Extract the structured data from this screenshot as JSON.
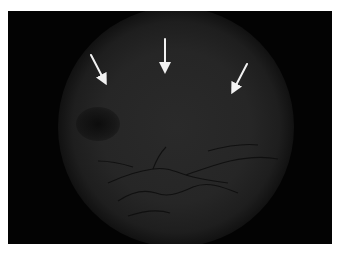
{
  "image": {
    "description": "Fundus photograph with three white arrows pointing toward the upper retina",
    "background_color": "#ffffff",
    "frame_color": "#030303",
    "fundus_color": "#262626",
    "arrow_color": "#f2f2f2",
    "vessel_color": "#0e0e0e"
  },
  "arrows": [
    {
      "name": "left-arrow",
      "x1": 83,
      "y1": 44,
      "x2": 98,
      "y2": 73
    },
    {
      "name": "center-arrow",
      "x1": 157,
      "y1": 28,
      "x2": 157,
      "y2": 61
    },
    {
      "name": "right-arrow",
      "x1": 239,
      "y1": 53,
      "x2": 224,
      "y2": 82
    }
  ]
}
